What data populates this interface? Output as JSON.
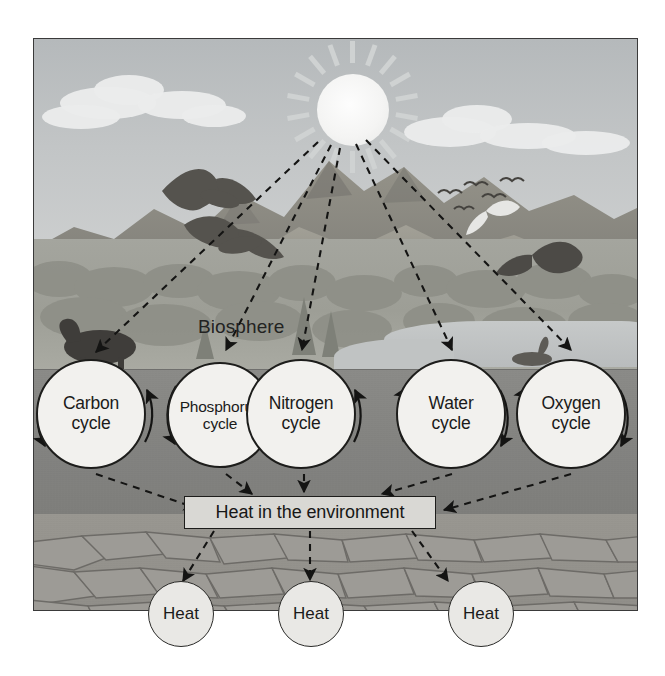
{
  "diagram": {
    "biosphere_label": "Biosphere",
    "heat_box_label": "Heat in the environment",
    "cycles": [
      {
        "label_line1": "Carbon",
        "label_line2": "cycle"
      },
      {
        "label_line1": "Phosphorus",
        "label_line2": "cycle"
      },
      {
        "label_line1": "Nitrogen",
        "label_line2": "cycle"
      },
      {
        "label_line1": "Water",
        "label_line2": "cycle"
      },
      {
        "label_line1": "Oxygen",
        "label_line2": "cycle"
      }
    ],
    "heat_nodes": [
      {
        "label": "Heat"
      },
      {
        "label": "Heat"
      },
      {
        "label": "Heat"
      }
    ],
    "scene": {
      "sun": "sun-icon",
      "clouds": "cloud-icon",
      "mountains": "mountain-range",
      "forest": "forest-band",
      "lake": "lake-water",
      "soil": "soil-layer",
      "bedrock": "bedrock-layer",
      "birds": "bird-flock-icon",
      "eagle": "eagle-icon",
      "bear": "bear-icon",
      "waterfowl": "waterfowl-icon"
    },
    "colors": {
      "sky": "#bfc2c3",
      "sun": "#f6f6f5",
      "mountain": "#8c8b87",
      "soil": "#8b8b88",
      "bedrock": "#96948f",
      "node_fill": "#f2f1ee",
      "heat_fill": "#e9e8e5",
      "box_fill": "#d9d8d4",
      "stroke": "#1d1d1b",
      "page": "#ffffff"
    }
  }
}
